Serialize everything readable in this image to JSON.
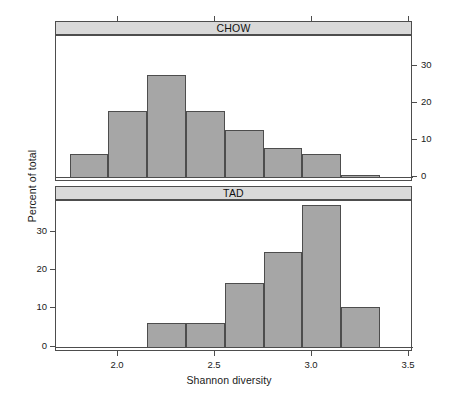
{
  "figure": {
    "xlabel": "Shannon diversity",
    "ylabel": "Percent of total"
  },
  "axes": {
    "x_ticks": [
      "2.0",
      "2.5",
      "3.0",
      "3.5"
    ],
    "y_ticks_chow": [
      "0",
      "10",
      "20",
      "30"
    ],
    "y_ticks_tad": [
      "0",
      "10",
      "20",
      "30"
    ]
  },
  "panels": [
    {
      "label": "CHOW"
    },
    {
      "label": "TAD"
    }
  ],
  "chart_data": {
    "type": "bar",
    "title": "",
    "subtitle": "",
    "xlabel": "Shannon diversity",
    "ylabel": "Percent of total",
    "xlim": [
      1.68,
      3.52
    ],
    "ylim": [
      -1.4,
      38.0
    ],
    "grid": false,
    "legend": "none",
    "layout": "2 stacked panels (lattice-style histograms), shared x axis; CHOW y-axis ticks drawn on right, TAD y-axis ticks drawn on left",
    "bin_width": 0.2,
    "panels": [
      {
        "name": "CHOW",
        "strip_label": "CHOW",
        "axis_side": "right",
        "bin_edges": [
          1.75,
          1.95,
          2.15,
          2.35,
          2.55,
          2.75,
          2.95,
          3.15,
          3.35,
          3.55
        ],
        "bin_centers": [
          1.85,
          2.05,
          2.25,
          2.45,
          2.65,
          2.85,
          3.05,
          3.25,
          3.45
        ],
        "values": [
          6.1,
          17.8,
          27.5,
          17.8,
          12.5,
          7.8,
          6.1,
          0.6
        ],
        "bars": [
          {
            "x0": 1.75,
            "x1": 1.95,
            "value": 6.1
          },
          {
            "x0": 1.95,
            "x1": 2.15,
            "value": 17.8
          },
          {
            "x0": 2.15,
            "x1": 2.35,
            "value": 27.5
          },
          {
            "x0": 2.35,
            "x1": 2.55,
            "value": 17.8
          },
          {
            "x0": 2.55,
            "x1": 2.75,
            "value": 12.5
          },
          {
            "x0": 2.75,
            "x1": 2.95,
            "value": 7.8
          },
          {
            "x0": 2.95,
            "x1": 3.15,
            "value": 6.1
          },
          {
            "x0": 3.15,
            "x1": 3.35,
            "value": 0.6
          }
        ]
      },
      {
        "name": "TAD",
        "strip_label": "TAD",
        "axis_side": "left",
        "bin_edges": [
          2.15,
          2.35,
          2.55,
          2.75,
          2.95,
          3.15,
          3.35
        ],
        "bin_centers": [
          2.25,
          2.45,
          2.65,
          2.85,
          3.05,
          3.25
        ],
        "values": [
          6.2,
          6.2,
          16.6,
          24.7,
          36.9,
          10.4
        ],
        "bars": [
          {
            "x0": 2.15,
            "x1": 2.35,
            "value": 6.2
          },
          {
            "x0": 2.35,
            "x1": 2.55,
            "value": 6.2
          },
          {
            "x0": 2.55,
            "x1": 2.75,
            "value": 16.6
          },
          {
            "x0": 2.75,
            "x1": 2.95,
            "value": 24.7
          },
          {
            "x0": 2.95,
            "x1": 3.15,
            "value": 36.9
          },
          {
            "x0": 3.15,
            "x1": 3.35,
            "value": 10.4
          }
        ]
      }
    ],
    "colors": {
      "bar_fill": "#a6a6a6",
      "bar_border": "#4d4d4d",
      "strip_fill": "#d9d9d9",
      "axis": "#4d4d4d",
      "background": "#ffffff"
    }
  }
}
